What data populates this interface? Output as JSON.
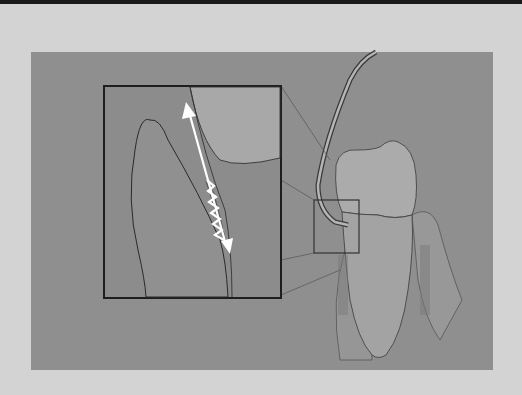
{
  "figure": {
    "colors": {
      "page_background": "#d3d3d3",
      "top_bar": "#1a1a1a",
      "panel_background": "#8f8f8f",
      "inset_background": "#8a8a8a",
      "tooth_fill": "#a6a6a6",
      "gingiva_fill": "#999999",
      "outline": "#2e2e2e",
      "arrow": "#ffffff"
    },
    "elements": {
      "inset_box": "magnified detail of instrument tip in sulcus",
      "detail_box": "region on tooth corresponding to inset",
      "arrow": "double-headed white arrow with zigzag segment indicating scaling stroke",
      "instrument": "curved dental scaler/curette",
      "tooth": "tooth crown and root with surrounding gingiva"
    }
  }
}
